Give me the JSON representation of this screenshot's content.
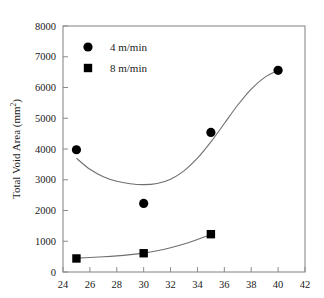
{
  "chart_data": {
    "type": "scatter",
    "title": "",
    "xlabel": "",
    "ylabel": "Total Void Area (mm2)",
    "ylabel_base": "Total Void Area (mm",
    "ylabel_sup": "2",
    "ylabel_close": ")",
    "xlim": [
      24,
      42
    ],
    "ylim": [
      0,
      8000
    ],
    "grid": false,
    "legend_position": "top-left",
    "xticks": [
      24,
      26,
      28,
      30,
      32,
      34,
      36,
      38,
      40,
      42
    ],
    "xtick_labels": [
      "24",
      "26",
      "28",
      "30",
      "32",
      "34",
      "36",
      "38",
      "40",
      "42"
    ],
    "yticks": [
      0,
      1000,
      2000,
      3000,
      4000,
      5000,
      6000,
      7000,
      8000
    ],
    "ytick_labels": [
      "0",
      "1000",
      "2000",
      "3000",
      "4000",
      "5000",
      "6000",
      "7000",
      "8000"
    ],
    "series": [
      {
        "name": "4 m/min",
        "marker": "circle",
        "color": "#000000",
        "x": [
          25,
          30,
          35,
          40
        ],
        "values": [
          3975,
          2230,
          4540,
          6560
        ],
        "fit_curve": [
          [
            25,
            3700
          ],
          [
            26,
            3340
          ],
          [
            27,
            3100
          ],
          [
            28,
            2950
          ],
          [
            29,
            2870
          ],
          [
            30,
            2840
          ],
          [
            31,
            2880
          ],
          [
            32,
            3020
          ],
          [
            33,
            3290
          ],
          [
            34,
            3700
          ],
          [
            35,
            4230
          ],
          [
            36,
            4830
          ],
          [
            37,
            5430
          ],
          [
            38,
            5950
          ],
          [
            39,
            6330
          ],
          [
            40,
            6560
          ]
        ]
      },
      {
        "name": "8 m/min",
        "marker": "square",
        "color": "#000000",
        "x": [
          25,
          30,
          35
        ],
        "values": [
          440,
          610,
          1230
        ],
        "fit_curve": [
          [
            25,
            450
          ],
          [
            26,
            470
          ],
          [
            27,
            495
          ],
          [
            28,
            525
          ],
          [
            29,
            565
          ],
          [
            30,
            615
          ],
          [
            31,
            690
          ],
          [
            32,
            790
          ],
          [
            33,
            910
          ],
          [
            34,
            1060
          ],
          [
            35,
            1225
          ]
        ]
      }
    ]
  },
  "legend": {
    "items": [
      {
        "label": "4 m/min",
        "marker": "circle"
      },
      {
        "label": "8 m/min",
        "marker": "square"
      }
    ]
  },
  "axes": {
    "y_title_base": "Total Void Area (mm",
    "y_title_sup": "2",
    "y_title_close": ")"
  }
}
